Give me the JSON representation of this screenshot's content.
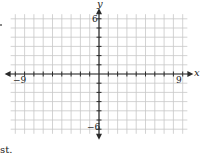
{
  "diagram": {
    "type": "coordinate-plane",
    "x_axis": {
      "label": "x",
      "min": -9,
      "max": 9,
      "min_label": "−9",
      "max_label": "9"
    },
    "y_axis": {
      "label": "y",
      "min": -6,
      "max": 6,
      "min_label": "−6",
      "max_label": "6"
    },
    "grid": {
      "step": 1,
      "x_from": -9,
      "x_to": 9,
      "y_from": -6,
      "y_to": 6
    },
    "colors": {
      "grid": "#c8c8c8",
      "axis": "#2a2a2a",
      "background": "#ffffff"
    }
  },
  "fragments": {
    "bottom_left_text": "st."
  }
}
